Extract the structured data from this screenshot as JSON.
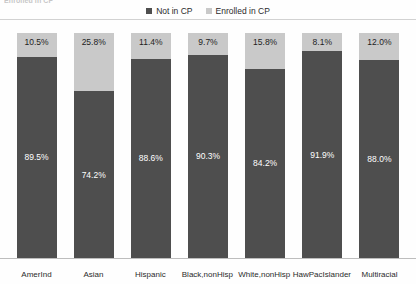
{
  "title_fragment": "Enrolled in CP",
  "legend": {
    "position": "top-center",
    "entries": [
      {
        "label": "Not in CP",
        "color": "#4e4e4e",
        "icon": "square-marker-icon"
      },
      {
        "label": "Enrolled in CP",
        "color": "#c9c9c9",
        "icon": "square-marker-icon"
      }
    ]
  },
  "chart_data": {
    "type": "bar",
    "subtype": "100% stacked bar",
    "title": "",
    "subtitle": "",
    "xlabel": "",
    "ylabel": "",
    "ylim": [
      0,
      100
    ],
    "grid": false,
    "legend_position": "top-center",
    "categories": [
      "AmerInd",
      "Asian",
      "Hispanic",
      "Black,nonHisp",
      "White,nonHisp",
      "HawPacIslander",
      "Multiracial"
    ],
    "series": [
      {
        "name": "Enrolled in CP",
        "color": "#c9c9c9",
        "stack_position": "top",
        "values": [
          10.5,
          25.8,
          11.4,
          9.7,
          15.8,
          8.1,
          12.0
        ],
        "labels": [
          "10.5%",
          "25.8%",
          "11.4%",
          "9.7%",
          "15.8%",
          "8.1%",
          "12.0%"
        ]
      },
      {
        "name": "Not in CP",
        "color": "#4e4e4e",
        "stack_position": "bottom",
        "values": [
          89.5,
          74.2,
          88.6,
          90.3,
          84.2,
          91.9,
          88.0
        ],
        "labels": [
          "89.5%",
          "74.2%",
          "88.6%",
          "90.3%",
          "84.2%",
          "91.9%",
          "88.0%"
        ]
      }
    ]
  }
}
